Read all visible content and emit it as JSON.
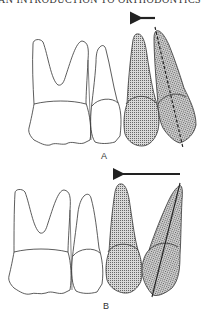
{
  "header": {
    "text": "AN INTRODUCTION TO ORTHODONTICS"
  },
  "figures": [
    {
      "id": "A",
      "label": "A",
      "arrow": "short-left",
      "axis_line": "dashed"
    },
    {
      "id": "B",
      "label": "B",
      "arrow": "long-left",
      "axis_line": "solid"
    }
  ],
  "colors": {
    "outline": "#333333",
    "shade": "#9a9a9a",
    "background": "#ffffff"
  }
}
